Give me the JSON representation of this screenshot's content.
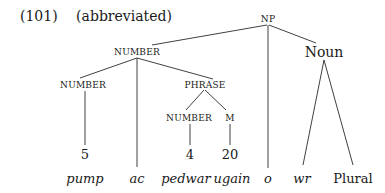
{
  "example": {
    "number": "(101)",
    "note": "(abbreviated)"
  },
  "tree": {
    "root": "NP",
    "nodes": {
      "np": "NP",
      "number_top": "NUMBER",
      "noun": "Noun",
      "number_left": "NUMBER",
      "phrase": "PHRASE",
      "number_phrase": "NUMBER",
      "m": "M"
    },
    "numerals": {
      "five": "5",
      "four": "4",
      "twenty": "20"
    },
    "leaves": {
      "pump": "pump",
      "ac": "ac",
      "pedwar": "pedwar",
      "ugain": "ugain",
      "o": "o",
      "wr": "wr",
      "plural": "Plural"
    }
  }
}
